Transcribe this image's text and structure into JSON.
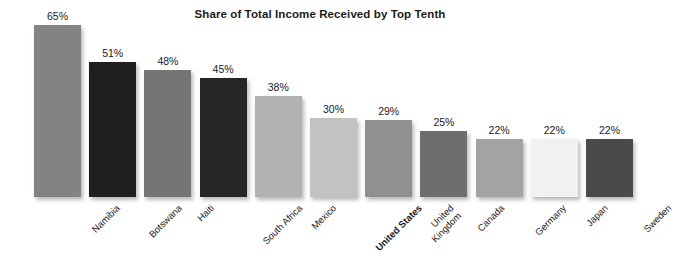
{
  "chart_data": {
    "type": "bar",
    "title": "Share of Total Income Received by Top Tenth",
    "xlabel": "",
    "ylabel": "",
    "ylim": [
      0,
      65
    ],
    "grid": false,
    "legend": "none",
    "value_suffix": "%",
    "categories": [
      "Namibia",
      "Botswana",
      "Haiti",
      "South Africa",
      "Mexico",
      "United States",
      "United Kingdom",
      "Canada",
      "Germany",
      "Japan",
      "Sweden"
    ],
    "values": [
      65,
      51,
      48,
      45,
      38,
      30,
      29,
      25,
      22,
      22,
      22
    ],
    "value_labels": [
      "65%",
      "51%",
      "48%",
      "45%",
      "38%",
      "30%",
      "29%",
      "25%",
      "22%",
      "22%",
      "22%"
    ],
    "bar_colors": [
      "#838383",
      "#1f1f1f",
      "#757575",
      "#262626",
      "#b2b2b2",
      "#c2c2c2",
      "#909090",
      "#6e6e6e",
      "#a3a3a3",
      "#f1f1f1",
      "#4a4a4a"
    ],
    "highlight_category": "United States",
    "label_lines": [
      [
        "Namibia"
      ],
      [
        "Botswana"
      ],
      [
        "Haiti"
      ],
      [
        "South Africa"
      ],
      [
        "Mexico"
      ],
      [
        "United States"
      ],
      [
        "United",
        "Kingdom"
      ],
      [
        "Canada"
      ],
      [
        "Germany"
      ],
      [
        "Japan"
      ],
      [
        "Sweden"
      ]
    ]
  },
  "colors": {
    "background": "#ffffff",
    "text": "#1a1a1a",
    "title": "#1b1b1b"
  }
}
